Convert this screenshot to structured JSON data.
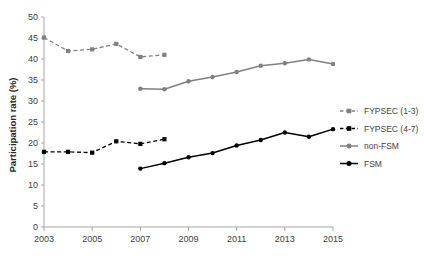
{
  "chart_data": {
    "type": "line",
    "title": "",
    "xlabel": "",
    "ylabel": "Participation rate (%)",
    "xlim": [
      2003,
      2015
    ],
    "ylim": [
      0,
      50
    ],
    "yticks": [
      0,
      5,
      10,
      15,
      20,
      25,
      30,
      35,
      40,
      45,
      50
    ],
    "xticks": [
      2003,
      2005,
      2007,
      2009,
      2011,
      2013,
      2015
    ],
    "xtick_labels": [
      "2003",
      "2005",
      "2007",
      "2009",
      "2011",
      "2013",
      "2015"
    ],
    "ytick_labels": [
      "0",
      "5",
      "10",
      "15",
      "20",
      "25",
      "30",
      "35",
      "40",
      "45",
      "50"
    ],
    "grid": false,
    "legend_position": "right",
    "series": [
      {
        "name": "FYPSEC (1-3)",
        "color": "#808080",
        "style": "dashed",
        "marker": "square",
        "x": [
          2003,
          2004,
          2005,
          2006,
          2007,
          2008
        ],
        "values": [
          45.1,
          41.9,
          42.3,
          43.6,
          40.5,
          41.0
        ]
      },
      {
        "name": "FYPSEC (4-7)",
        "color": "#000000",
        "style": "dashed",
        "marker": "square",
        "x": [
          2003,
          2004,
          2005,
          2006,
          2007,
          2008
        ],
        "values": [
          17.9,
          17.9,
          17.7,
          20.4,
          19.8,
          20.9
        ]
      },
      {
        "name": "non-FSM",
        "color": "#808080",
        "style": "solid",
        "marker": "circle",
        "x": [
          2007,
          2008,
          2009,
          2010,
          2011,
          2012,
          2013,
          2014,
          2015
        ],
        "values": [
          32.9,
          32.8,
          34.7,
          35.7,
          36.9,
          38.4,
          39.0,
          39.9,
          38.8
        ]
      },
      {
        "name": "FSM",
        "color": "#000000",
        "style": "solid",
        "marker": "circle",
        "x": [
          2007,
          2008,
          2009,
          2010,
          2011,
          2012,
          2013,
          2014,
          2015
        ],
        "values": [
          13.9,
          15.2,
          16.6,
          17.6,
          19.4,
          20.7,
          22.5,
          21.5,
          23.3
        ]
      }
    ]
  },
  "legend": {
    "items": [
      {
        "label": "FYPSEC (1-3)"
      },
      {
        "label": "FYPSEC (4-7)"
      },
      {
        "label": "non-FSM"
      },
      {
        "label": "FSM"
      }
    ]
  },
  "axes": {
    "y_title": "Participation rate (%)"
  }
}
